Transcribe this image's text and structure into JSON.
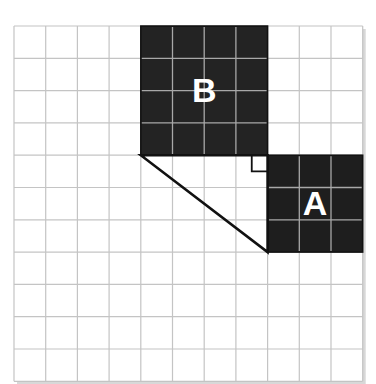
{
  "diagram": {
    "title": "",
    "grid": {
      "cols": 11,
      "rows": 11,
      "origin_x": 14,
      "origin_y": 26,
      "cell_w": 31.7,
      "cell_h": 32.3,
      "line_color": "#c4c4c4",
      "shadow_color": "#d8d8d8"
    },
    "squares": [
      {
        "label": "B",
        "col": 4,
        "row": 0,
        "size": 4,
        "fill": "#232323",
        "inner_line": "#a8a8a8",
        "text_color": "#ffffff"
      },
      {
        "label": "A",
        "col": 8,
        "row": 4,
        "size": 3,
        "fill": "#1e1e1e",
        "inner_line": "#a8a8a8",
        "text_color": "#ffffff"
      }
    ],
    "triangle": {
      "vertices": [
        [
          4,
          4
        ],
        [
          8,
          4
        ],
        [
          8,
          7
        ]
      ],
      "stroke": "#111111",
      "right_angle_vertex": [
        8,
        4
      ],
      "right_angle_marker_size": 0.5
    }
  }
}
